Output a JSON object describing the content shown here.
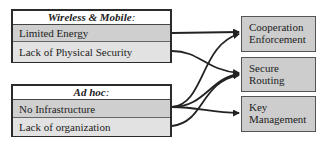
{
  "groups": [
    {
      "title": "Wireless & Mobile",
      "colon": ":",
      "items": [
        "Limited Energy",
        "Lack of Physical Security"
      ]
    },
    {
      "title": "Ad hoc",
      "colon": ":",
      "items": [
        "No Infrastructure",
        "Lack of organization"
      ]
    }
  ],
  "targets": [
    {
      "line1": "Cooperation",
      "line2": "Enforcement"
    },
    {
      "line1": "Secure",
      "line2": "Routing"
    },
    {
      "line1": "Key",
      "line2": "Management"
    }
  ],
  "edges": [
    {
      "from": "Limited Energy",
      "to": "Cooperation Enforcement"
    },
    {
      "from": "Lack of Physical Security",
      "to": "Secure Routing"
    },
    {
      "from": "No Infrastructure",
      "to": "Cooperation Enforcement"
    },
    {
      "from": "No Infrastructure",
      "to": "Secure Routing"
    },
    {
      "from": "No Infrastructure",
      "to": "Key Management"
    },
    {
      "from": "Lack of organization",
      "to": "Secure Routing"
    }
  ],
  "colors": {
    "border": "#2b2b2b",
    "row_dark": "#cfcfcf",
    "row_light": "#e2e2e2",
    "target_fill": "#cdcdcd",
    "arrow": "#222222"
  }
}
